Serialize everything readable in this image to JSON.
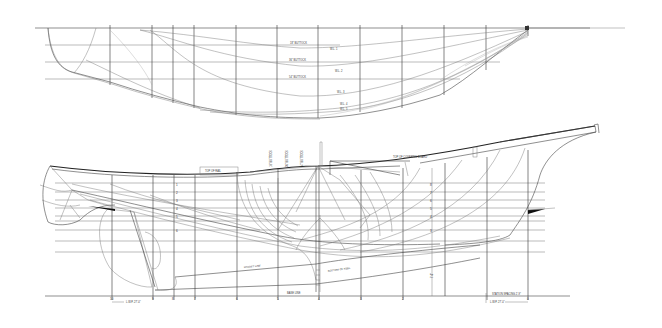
{
  "drawing": {
    "type": "Lines plan (sailing yacht)",
    "background": "#ffffff",
    "ink_color": "#333333"
  },
  "half_breadth_plan": {
    "buttock_labels": [
      "18\" BUTTOCK",
      "36\" BUTTOCK",
      "54\" BUTTOCK"
    ],
    "waterline_labels": [
      "W.L. 1",
      "W.L. 2",
      "W.L. 3",
      "W.L. 4",
      "W.L. 5"
    ]
  },
  "profile_plan": {
    "labels": {
      "top_of_rail": "TOP OF RAIL",
      "top_of_covering_board": "TOP OF COVERING BOARD",
      "rabbet_line": "RABBET LINE",
      "bottom_of_keel": "BOTTOM OF KEEL",
      "base_line": "BASE LINE",
      "buttock_18": "18\" BUTTOCK",
      "buttock_36": "36\" BUTTOCK",
      "buttock_54": "54\" BUTTOCK",
      "station_spacing": "STATION SPACING 2'-9\"",
      "lwl_aft": "L.W.P. 27'-0\"",
      "lwl_fwd": "L.W.P. 27'-0\"",
      "height_dim": "7'-0\""
    },
    "station_numbers": [
      "10",
      "9",
      "8",
      "7",
      "6",
      "5",
      "4",
      "3",
      "2",
      "1",
      "0"
    ],
    "waterline_numbers": [
      "1",
      "2",
      "3",
      "4",
      "5",
      "6",
      "7",
      "8"
    ]
  }
}
